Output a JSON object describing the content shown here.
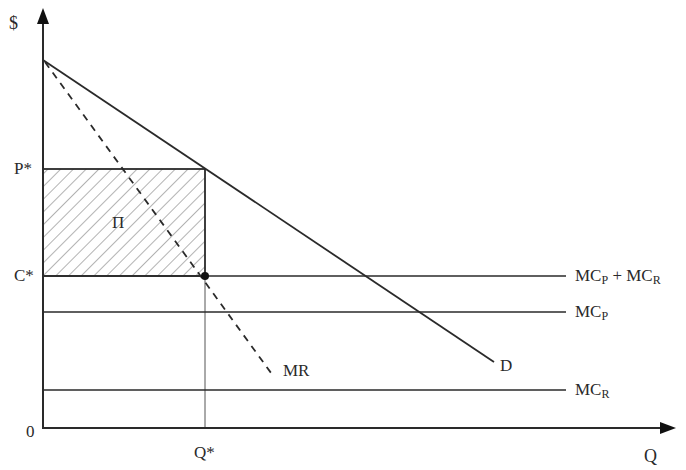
{
  "diagram": {
    "axes": {
      "y_label": "$",
      "x_label": "Q",
      "origin_label": "0"
    },
    "price_labels": {
      "p_star": "P*",
      "c_star": "C*"
    },
    "quantity_labels": {
      "q_star": "Q*"
    },
    "curves": {
      "demand": "D",
      "marginal_revenue": "MR",
      "mc_total": {
        "main": "MC",
        "sub1": "P",
        "plus": " + MC",
        "sub2": "R"
      },
      "mc_p": {
        "main": "MC",
        "sub": "P"
      },
      "mc_r": {
        "main": "MC",
        "sub": "R"
      }
    },
    "profit_region_label": "Π",
    "colors": {
      "line": "#2a2a2a",
      "hatch": "#9a9a9a",
      "background": "#ffffff"
    }
  }
}
